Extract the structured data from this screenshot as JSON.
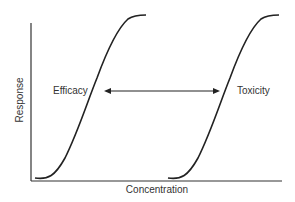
{
  "diagram": {
    "title": "",
    "x_axis_label": "Concentration",
    "y_axis_label": "Response",
    "curves": [
      {
        "name": "Efficacy",
        "shape": "sigmoid",
        "position": "left"
      },
      {
        "name": "Toxicity",
        "shape": "sigmoid",
        "position": "right"
      }
    ],
    "annotation": {
      "type": "double-headed-arrow",
      "meaning": "separation between efficacy and toxicity curves (therapeutic window)"
    },
    "colors": {
      "line": "#222222",
      "text": "#333333",
      "background": "#ffffff"
    }
  }
}
